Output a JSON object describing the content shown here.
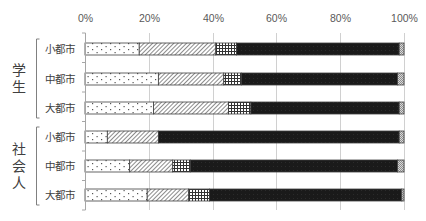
{
  "chart_data": {
    "type": "bar",
    "orientation": "horizontal",
    "stacked": true,
    "percent": true,
    "title": "",
    "xlabel": "",
    "ylabel": "",
    "xlim": [
      0,
      100
    ],
    "x_ticks": [
      "0%",
      "20%",
      "40%",
      "60%",
      "80%",
      "100%"
    ],
    "x_axis_position": "top",
    "grid": true,
    "legend": null,
    "groups": [
      {
        "label": "学生",
        "categories": [
          "小都市",
          "中都市",
          "大都市"
        ]
      },
      {
        "label": "社会人",
        "categories": [
          "小都市",
          "中都市",
          "大都市"
        ]
      }
    ],
    "categories": [
      "小都市",
      "中都市",
      "大都市",
      "小都市",
      "中都市",
      "大都市"
    ],
    "series": [
      {
        "name": "series-1",
        "pattern": "dotted",
        "values": [
          17.0,
          23.0,
          21.5,
          7.0,
          14.0,
          19.5
        ]
      },
      {
        "name": "series-2",
        "pattern": "diagonal-hatch",
        "values": [
          24.0,
          20.5,
          23.5,
          16.0,
          13.5,
          13.0
        ]
      },
      {
        "name": "series-3",
        "pattern": "grid",
        "values": [
          6.5,
          5.5,
          7.0,
          0.0,
          5.5,
          6.5
        ]
      },
      {
        "name": "series-4",
        "pattern": "solid-black",
        "values": [
          51.0,
          49.0,
          46.5,
          75.5,
          65.0,
          60.3
        ]
      },
      {
        "name": "series-5",
        "pattern": "dense-crosshatch",
        "values": [
          1.5,
          2.0,
          1.5,
          1.5,
          2.0,
          0.7
        ]
      }
    ]
  },
  "colors": {
    "axis": "#a6a6a6",
    "bar_border": "#404040",
    "solid": "#1a1a1a",
    "pattern_ink": "#7f7f7f",
    "text": "#404040"
  }
}
